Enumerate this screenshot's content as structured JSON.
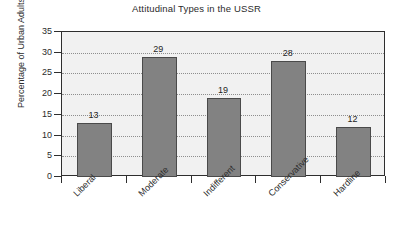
{
  "chart_data": {
    "type": "bar",
    "title": "Attitudinal Types in the USSR",
    "xlabel": "",
    "ylabel": "Percentage of Urban Adults",
    "categories": [
      "Liberal",
      "Moderate",
      "Indifferent",
      "Conservative",
      "Hardline"
    ],
    "values": [
      13,
      29,
      19,
      28,
      12
    ],
    "value_labels": [
      "13",
      "29",
      "19",
      "28",
      "12"
    ],
    "ylim": [
      0,
      35
    ],
    "ytick_labels": [
      "0",
      "5",
      "10",
      "15",
      "20",
      "25",
      "30",
      "35"
    ],
    "ytick_values": [
      0,
      5,
      10,
      15,
      20,
      25,
      30,
      35
    ],
    "grid": "horizontal-dotted",
    "legend": "none",
    "bar_color": "#828282",
    "bar_edge_color": "#4a4a4a",
    "plot_background": "#f1f1f1",
    "axis_color": "#2e2e2e",
    "gridline_color": "#8e8e8e",
    "page_background": "#ffffff"
  }
}
